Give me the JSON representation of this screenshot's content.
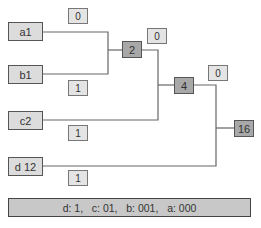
{
  "leaves": [
    {
      "label": "a1"
    },
    {
      "label": "b1"
    },
    {
      "label": "c2"
    },
    {
      "label": "d 12"
    }
  ],
  "internal_nodes": [
    {
      "label": "2"
    },
    {
      "label": "4"
    },
    {
      "label": "16"
    }
  ],
  "edge_labels": [
    {
      "label": "0"
    },
    {
      "label": "1"
    },
    {
      "label": "0"
    },
    {
      "label": "1"
    },
    {
      "label": "0"
    },
    {
      "label": "1"
    }
  ],
  "code_summary": "d: 1,   c: 01,   b: 001,   a: 000",
  "colors": {
    "leaf_fill": "#dcdcdc",
    "internal_fill": "#a8a8a8",
    "line": "#666666"
  }
}
